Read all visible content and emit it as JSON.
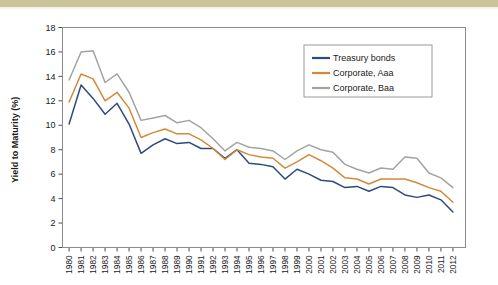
{
  "figure": {
    "background_color": "#ffffff",
    "top_band_color": "#c9c49a",
    "frame_color": "#8c8c8c"
  },
  "chart_data": {
    "type": "line",
    "title": "",
    "xlabel": "",
    "ylabel": "Yield to Maturity (%)",
    "ylim": [
      0,
      18
    ],
    "y_ticks": [
      0,
      2,
      4,
      6,
      8,
      10,
      12,
      14,
      16,
      18
    ],
    "y_tick_labels": [
      "0",
      "2",
      "4",
      "6",
      "8",
      "10",
      "12",
      "14",
      "16",
      "18"
    ],
    "grid": false,
    "legend_position": "upper right",
    "x": [
      1980,
      1981,
      1982,
      1983,
      1984,
      1985,
      1986,
      1987,
      1988,
      1989,
      1990,
      1991,
      1992,
      1993,
      1994,
      1995,
      1996,
      1997,
      1998,
      1999,
      2000,
      2001,
      2002,
      2003,
      2004,
      2005,
      2006,
      2007,
      2008,
      2009,
      2010,
      2011,
      2012
    ],
    "categories": [
      "1980",
      "1981",
      "1982",
      "1983",
      "1984",
      "1985",
      "1986",
      "1987",
      "1988",
      "1989",
      "1990",
      "1991",
      "1992",
      "1993",
      "1994",
      "1995",
      "1996",
      "1997",
      "1998",
      "1999",
      "2000",
      "2001",
      "2002",
      "2003",
      "2004",
      "2005",
      "2006",
      "2007",
      "2008",
      "2009",
      "2010",
      "2011",
      "2012"
    ],
    "series": [
      {
        "name": "Treasury bonds",
        "color": "#2e4a7d",
        "values": [
          10.1,
          13.3,
          12.2,
          10.9,
          11.8,
          10.1,
          7.7,
          8.4,
          8.9,
          8.5,
          8.6,
          8.1,
          8.1,
          7.3,
          8.0,
          6.9,
          6.8,
          6.6,
          5.6,
          6.4,
          6.0,
          5.5,
          5.4,
          4.9,
          5.0,
          4.6,
          5.0,
          4.9,
          4.3,
          4.1,
          4.3,
          3.9,
          2.9
        ]
      },
      {
        "name": "Corporate, Aaa",
        "color": "#d4893a",
        "values": [
          11.9,
          14.2,
          13.8,
          12.0,
          12.7,
          11.4,
          9.0,
          9.4,
          9.7,
          9.3,
          9.3,
          8.8,
          8.1,
          7.2,
          8.0,
          7.6,
          7.4,
          7.3,
          6.5,
          7.0,
          7.6,
          7.1,
          6.5,
          5.7,
          5.6,
          5.2,
          5.6,
          5.6,
          5.6,
          5.3,
          4.9,
          4.6,
          3.7
        ]
      },
      {
        "name": "Corporate, Baa",
        "color": "#a0a5a0",
        "values": [
          13.7,
          16.0,
          16.1,
          13.5,
          14.2,
          12.7,
          10.4,
          10.6,
          10.8,
          10.2,
          10.4,
          9.8,
          8.9,
          7.9,
          8.6,
          8.2,
          8.1,
          7.9,
          7.2,
          7.9,
          8.4,
          8.0,
          7.8,
          6.8,
          6.4,
          6.1,
          6.5,
          6.4,
          7.4,
          7.3,
          6.1,
          5.7,
          4.9
        ]
      }
    ]
  }
}
